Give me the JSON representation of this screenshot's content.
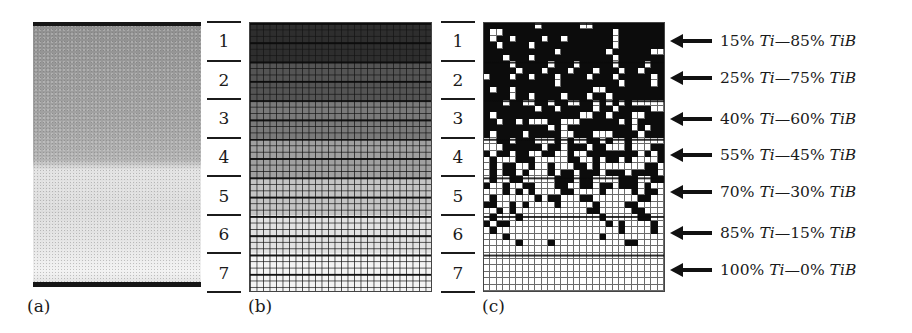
{
  "figure": {
    "panels": [
      {
        "id": "a",
        "caption": "(a)",
        "description": "micrograph of graded Ti–TiB specimen"
      },
      {
        "id": "b",
        "caption": "(b)",
        "description": "grayscale graded finite-element mesh"
      },
      {
        "id": "c",
        "caption": "(c)",
        "description": "binary (black = TiB, white = Ti) element assignment mesh"
      }
    ],
    "layers": [
      "1",
      "2",
      "3",
      "4",
      "5",
      "6",
      "7"
    ],
    "compositions": [
      {
        "layer": "1",
        "ti_pct": "15%",
        "ti": "Ti",
        "sep": "—",
        "tib_pct": "85%",
        "tib": "TiB"
      },
      {
        "layer": "2",
        "ti_pct": "25%",
        "ti": "Ti",
        "sep": "—",
        "tib_pct": "75%",
        "tib": "TiB"
      },
      {
        "layer": "3",
        "ti_pct": "40%",
        "ti": "Ti",
        "sep": "—",
        "tib_pct": "60%",
        "tib": "TiB"
      },
      {
        "layer": "4",
        "ti_pct": "55%",
        "ti": "Ti",
        "sep": "—",
        "tib_pct": "45%",
        "tib": "TiB"
      },
      {
        "layer": "5",
        "ti_pct": "70%",
        "ti": "Ti",
        "sep": "—",
        "tib_pct": "30%",
        "tib": "TiB"
      },
      {
        "layer": "6",
        "ti_pct": "85%",
        "ti": "Ti",
        "sep": "—",
        "tib_pct": "15%",
        "tib": "TiB"
      },
      {
        "layer": "7",
        "ti_pct": "100%",
        "ti": "Ti",
        "sep": "—",
        "tib_pct": "0%",
        "tib": "TiB"
      }
    ],
    "band_grays": [
      "#2e2e2e",
      "#545454",
      "#7a7a7a",
      "#a0a0a0",
      "#c4c4c4",
      "#e2e2e2",
      "#f4f4f4"
    ],
    "mesh_c": {
      "cols": 28,
      "rows": 42,
      "pattern": [
        "1111111101111110011111111111",
        "1001111111111111111101111111",
        "1011011110110111111101111111",
        "1101111011111111111101111111",
        "1111111111101111111011111100",
        "1110111011111111111101111111",
        "1111011111011101111101111011",
        "1111101110111011101110110111",
        "0111011011101111011101111101",
        "1111111111101111111110111101",
        "1011011111111111100111111111",
        "1111011011110111011011111111",
        "1110110011011001101010100000",
        "1111111101101111101101111100",
        "1011111111111110011011100111",
        "1101101000110001111110101111",
        "1111111111010111111111101011",
        "1011110111110011100011110111",
        "0011011100010100110100100000",
        "0001111110110111011000100011",
        "1011011001100100111111110101",
        "0100011100000110010110100001",
        "0101100100100011010000000110",
        "0101101000101101110111011110",
        "0100110000011101100001110011",
        "1001001100011001101101110100",
        "0001010100001100001000010110",
        "0100000010110001100000001100",
        "1100101000010000010000110000",
        "0010100000000000110000011000",
        "0100010000000000001000001100",
        "1011000000000000000101000010",
        "0100000000000000000001000010",
        "0001000000000000001000000000",
        "0000010000100000000000110000",
        "0000000000000000000000000000",
        "0000000000000000000000000000",
        "0000000000000000000000000000",
        "0000000000000000000000000000",
        "0000000000000000000000000000",
        "0000000000000000000000000000",
        "0000000000000000000000000000"
      ]
    }
  }
}
